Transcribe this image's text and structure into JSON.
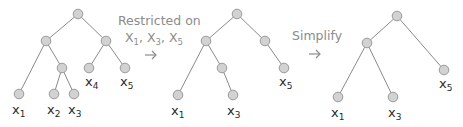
{
  "diagram": {
    "steps": [
      {
        "label": "Restricted on",
        "vars": [
          "X",
          "1",
          ", X",
          "3",
          ", X",
          "5"
        ]
      },
      {
        "label": "Simplify"
      }
    ],
    "trees": [
      {
        "name": "original",
        "nodes": [
          {
            "id": "r",
            "x": 78,
            "y": 14
          },
          {
            "id": "a",
            "x": 46,
            "y": 41
          },
          {
            "id": "b",
            "x": 106,
            "y": 41
          },
          {
            "id": "c",
            "x": 62,
            "y": 68
          },
          {
            "id": "x4",
            "x": 89,
            "y": 68
          },
          {
            "id": "x5",
            "x": 125,
            "y": 68
          },
          {
            "id": "x1",
            "x": 19,
            "y": 94
          },
          {
            "id": "x2",
            "x": 54,
            "y": 94
          },
          {
            "id": "x3",
            "x": 74,
            "y": 94
          }
        ],
        "edges": [
          [
            "r",
            "a"
          ],
          [
            "r",
            "b"
          ],
          [
            "a",
            "x1"
          ],
          [
            "a",
            "c"
          ],
          [
            "c",
            "x2"
          ],
          [
            "c",
            "x3"
          ],
          [
            "b",
            "x4"
          ],
          [
            "b",
            "x5"
          ]
        ],
        "labels": [
          {
            "var": "x",
            "sub": "1",
            "x": 12,
            "y": 114
          },
          {
            "var": "x",
            "sub": "2",
            "x": 47,
            "y": 114
          },
          {
            "var": "x",
            "sub": "3",
            "x": 68,
            "y": 114
          },
          {
            "var": "x",
            "sub": "4",
            "x": 85,
            "y": 86
          },
          {
            "var": "x",
            "sub": "5",
            "x": 120,
            "y": 86
          }
        ]
      },
      {
        "name": "restricted",
        "nodes": [
          {
            "id": "r",
            "x": 237,
            "y": 14
          },
          {
            "id": "a",
            "x": 206,
            "y": 41
          },
          {
            "id": "b",
            "x": 265,
            "y": 41
          },
          {
            "id": "c",
            "x": 222,
            "y": 68
          },
          {
            "id": "x5",
            "x": 284,
            "y": 68
          },
          {
            "id": "x1",
            "x": 178,
            "y": 95
          },
          {
            "id": "x3",
            "x": 233,
            "y": 95
          }
        ],
        "edges": [
          [
            "r",
            "a"
          ],
          [
            "r",
            "b"
          ],
          [
            "a",
            "x1"
          ],
          [
            "a",
            "c"
          ],
          [
            "c",
            "x3"
          ],
          [
            "b",
            "x5"
          ]
        ],
        "labels": [
          {
            "var": "x",
            "sub": "1",
            "x": 171,
            "y": 115
          },
          {
            "var": "x",
            "sub": "3",
            "x": 227,
            "y": 115
          },
          {
            "var": "x",
            "sub": "5",
            "x": 279,
            "y": 86
          }
        ]
      },
      {
        "name": "simplified",
        "nodes": [
          {
            "id": "r",
            "x": 397,
            "y": 16
          },
          {
            "id": "a",
            "x": 367,
            "y": 43
          },
          {
            "id": "x5",
            "x": 444,
            "y": 70
          },
          {
            "id": "x1",
            "x": 338,
            "y": 97
          },
          {
            "id": "x3",
            "x": 393,
            "y": 97
          }
        ],
        "edges": [
          [
            "r",
            "a"
          ],
          [
            "r",
            "x5"
          ],
          [
            "a",
            "x1"
          ],
          [
            "a",
            "x3"
          ]
        ],
        "labels": [
          {
            "var": "x",
            "sub": "1",
            "x": 331,
            "y": 117
          },
          {
            "var": "x",
            "sub": "3",
            "x": 388,
            "y": 117
          },
          {
            "var": "x",
            "sub": "5",
            "x": 439,
            "y": 88
          }
        ]
      }
    ],
    "colors": {
      "node_fill": "#d2d2d2",
      "node_stroke": "#9a9a9a",
      "edge": "#8a8a8a",
      "caption": "#8c8c8c",
      "label": "#2a2a2a"
    }
  }
}
